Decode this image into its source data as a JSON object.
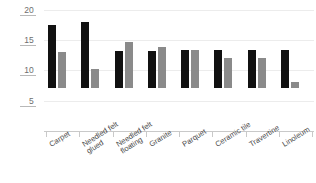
{
  "chart_data": {
    "type": "bar",
    "title": "",
    "subtitle": "",
    "xlabel": "",
    "ylabel": "",
    "ylim": [
      0,
      21
    ],
    "yticks": [
      5,
      10,
      15,
      20
    ],
    "ytick_labels": [
      "5",
      "10",
      "15",
      "20"
    ],
    "grid": true,
    "legend": null,
    "categories": [
      "Carpet",
      "Needled felt glued",
      "Needled felt floating",
      "Granite",
      "Parquet",
      "Ceramic tile",
      "Travertine",
      "Linoleum"
    ],
    "category_lines": [
      [
        "Carpet",
        ""
      ],
      [
        "Needled felt",
        "glued"
      ],
      [
        "Needled felt",
        "floating"
      ],
      [
        "Granite",
        ""
      ],
      [
        "Parquet",
        ""
      ],
      [
        "Ceramic tile",
        ""
      ],
      [
        "Travertine",
        ""
      ],
      [
        "Linoleum",
        ""
      ]
    ],
    "series": [
      {
        "name": "series-1",
        "color": "#111111",
        "values": [
          10.4,
          10.9,
          6.2,
          6.1,
          6.3,
          6.3,
          6.3,
          6.3
        ]
      },
      {
        "name": "series-2",
        "color": "#8a8a8a",
        "values": [
          6.0,
          3.2,
          7.6,
          6.7,
          6.3,
          4.9,
          4.9,
          1.0
        ]
      }
    ]
  },
  "axis": {
    "y_tick_20": "20",
    "y_tick_15": "15",
    "y_tick_10": "10",
    "y_tick_5": "5"
  }
}
